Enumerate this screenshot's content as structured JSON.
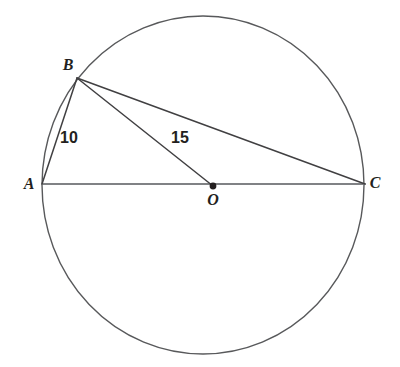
{
  "figure": {
    "title": "Circle with inscribed right triangle ABC and radius OB",
    "background_color": "#ffffff",
    "stroke_colors": {
      "circle": "#58595b",
      "chord": "#414042",
      "diameter": "#808285",
      "center_dot": "#231f20"
    },
    "circle": {
      "name": "circle-O",
      "cx": 203,
      "cy": 185,
      "rx": 161,
      "ry": 169,
      "stroke_width": 1.4
    },
    "points": [
      {
        "id": "A",
        "label": "A",
        "x": 42,
        "y": 184,
        "label_x": 29,
        "label_y": 184,
        "dot": false
      },
      {
        "id": "B",
        "label": "B",
        "x": 77,
        "y": 78,
        "label_x": 68,
        "label_y": 65,
        "dot": false
      },
      {
        "id": "C",
        "label": "C",
        "x": 365,
        "y": 184,
        "label_x": 375,
        "label_y": 183,
        "dot": false
      },
      {
        "id": "O",
        "label": "O",
        "x": 213,
        "y": 186,
        "label_x": 213,
        "label_y": 200,
        "dot": true
      }
    ],
    "segments": [
      {
        "id": "AC",
        "from": "A",
        "to": "C",
        "x1": 42,
        "y1": 184,
        "x2": 365,
        "y2": 184,
        "color": "#808285",
        "width": 2.0,
        "label": null
      },
      {
        "id": "AB",
        "from": "A",
        "to": "B",
        "x1": 42,
        "y1": 184,
        "x2": 77,
        "y2": 78,
        "color": "#414042",
        "width": 1.5,
        "label": "10"
      },
      {
        "id": "BO",
        "from": "B",
        "to": "O",
        "x1": 77,
        "y1": 78,
        "x2": 213,
        "y2": 186,
        "color": "#414042",
        "width": 1.5,
        "label": "15"
      },
      {
        "id": "BC",
        "from": "B",
        "to": "C",
        "x1": 77,
        "y1": 78,
        "x2": 365,
        "y2": 184,
        "color": "#414042",
        "width": 1.5,
        "label": null
      }
    ],
    "measurements": [
      {
        "id": "AB-length",
        "value": "10",
        "x": 69,
        "y": 138
      },
      {
        "id": "BO-length",
        "value": "15",
        "x": 180,
        "y": 138
      }
    ],
    "center_dot_radius": 3.4
  }
}
